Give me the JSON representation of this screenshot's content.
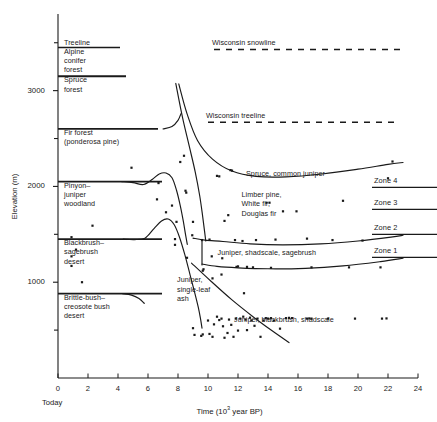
{
  "chart_data": {
    "type": "line",
    "title": "",
    "xlabel": "Time (10³ year BP)",
    "ylabel": "Elevation (m)",
    "xlim": [
      0,
      24
    ],
    "ylim": [
      0,
      3800
    ],
    "grid": false,
    "legend_position": "none",
    "x_ticks_major": [
      0,
      2,
      4,
      6,
      8,
      10,
      12,
      14,
      16,
      18,
      20,
      22,
      24
    ],
    "x_tick_labels": [
      "0",
      "2",
      "4",
      "6",
      "8",
      "10",
      "12",
      "14",
      "16",
      "18",
      "20",
      "22",
      "24"
    ],
    "x_origin_note": "Today",
    "y_ticks_major": [
      1000,
      2000,
      3000
    ],
    "y_tick_labels": [
      "1000",
      "2000",
      "3000"
    ],
    "y_ticks_minor": [
      500,
      1500,
      2500,
      3500
    ],
    "vegetation_bands": [
      {
        "label": "Treeline",
        "elevation": 3500,
        "type": "tick-label"
      },
      {
        "label": "Alpine\nconifer\nforest",
        "top": 3450,
        "bottom": 3150
      },
      {
        "label": "Spruce\nforest",
        "top": 3150,
        "bottom": 2600
      },
      {
        "label": "Fir forest\n(ponderosa pine)",
        "top": 2600,
        "bottom": 2050
      },
      {
        "label": "Pinyon–\njuniper\nwoodland",
        "top": 2050,
        "bottom": 1450
      },
      {
        "label": "Blackbrush–\nsagebrush\ndesert",
        "top": 1450,
        "bottom": 880
      },
      {
        "label": "Brittle-bush–\ncreosote bush\ndesert",
        "top": 880,
        "bottom": 300
      }
    ],
    "reference_lines": [
      {
        "name": "Wisconsin snowline",
        "style": "dashed",
        "elevation": 3430,
        "x_start": 10.4,
        "x_end": 22.8
      },
      {
        "name": "Wisconsin treeline",
        "style": "dashed",
        "elevation": 2670,
        "x_start": 10.0,
        "x_end": 22.8
      }
    ],
    "curve_labels": [
      {
        "text": "Spruce, common juniper",
        "x": 12.6,
        "y": 2130
      },
      {
        "text": "Limber pine,\nWhite fir,\nDouglas fir",
        "x": 12.3,
        "y": 1910
      },
      {
        "text": "Juniper, shadscale, sagebrush",
        "x": 10.7,
        "y": 1310
      },
      {
        "text": "Juniper,\nsingle-leaf\nash",
        "x": 8.0,
        "y": 1020
      },
      {
        "text": "Juniper, blackbrush, shadscale",
        "x": 11.8,
        "y": 610
      }
    ],
    "zones": [
      {
        "label": "Zone 4",
        "elevation": 1990
      },
      {
        "label": "Zone 3",
        "elevation": 1760
      },
      {
        "label": "Zone 2",
        "elevation": 1500
      },
      {
        "label": "Zone 1",
        "elevation": 1260
      }
    ],
    "series": [
      {
        "name": "spruce-common-juniper-boundary",
        "points": [
          [
            8.05,
            3070
          ],
          [
            8.6,
            2760
          ],
          [
            9.3,
            2480
          ],
          [
            10.3,
            2285
          ],
          [
            11.6,
            2160
          ],
          [
            13.2,
            2105
          ],
          [
            15.2,
            2100
          ],
          [
            17.6,
            2130
          ],
          [
            20.0,
            2180
          ],
          [
            22.0,
            2230
          ],
          [
            23.0,
            2250
          ]
        ]
      },
      {
        "name": "limber-pine-white-fir-boundary",
        "points": [
          [
            7.85,
            3075
          ],
          [
            8.3,
            2720
          ],
          [
            8.75,
            2420
          ],
          [
            9.15,
            2150
          ],
          [
            9.45,
            1900
          ],
          [
            9.65,
            1680
          ],
          [
            9.78,
            1520
          ],
          [
            9.85,
            1430
          ]
        ]
      },
      {
        "name": "zone2-upper-boundary",
        "points": [
          [
            9.0,
            1460
          ],
          [
            9.8,
            1440
          ],
          [
            11.0,
            1425
          ],
          [
            12.8,
            1400
          ],
          [
            15.0,
            1390
          ],
          [
            17.5,
            1400
          ],
          [
            20.0,
            1430
          ],
          [
            22.2,
            1470
          ],
          [
            23.0,
            1490
          ]
        ]
      },
      {
        "name": "pinyon-juniper-rise",
        "points": [
          [
            4.25,
            2050
          ],
          [
            5.0,
            2040
          ],
          [
            5.7,
            2020
          ],
          [
            6.3,
            2075
          ],
          [
            6.75,
            2130
          ],
          [
            7.2,
            2140
          ],
          [
            7.6,
            2090
          ],
          [
            7.9,
            1960
          ],
          [
            8.15,
            1800
          ],
          [
            8.35,
            1640
          ],
          [
            8.5,
            1500
          ],
          [
            8.62,
            1395
          ]
        ]
      },
      {
        "name": "blackbrush-sagebrush-rise",
        "points": [
          [
            4.35,
            1450
          ],
          [
            5.1,
            1445
          ],
          [
            5.8,
            1460
          ],
          [
            6.4,
            1560
          ],
          [
            6.9,
            1640
          ],
          [
            7.35,
            1660
          ],
          [
            7.75,
            1600
          ],
          [
            8.1,
            1470
          ],
          [
            8.45,
            1290
          ],
          [
            8.8,
            1080
          ],
          [
            9.1,
            900
          ],
          [
            9.35,
            740
          ],
          [
            9.5,
            620
          ],
          [
            9.6,
            520
          ]
        ]
      },
      {
        "name": "juniper-shadscale-boundary",
        "points": [
          [
            9.6,
            1190
          ],
          [
            10.6,
            1165
          ],
          [
            12.0,
            1150
          ],
          [
            14.0,
            1140
          ],
          [
            16.5,
            1145
          ],
          [
            19.0,
            1170
          ],
          [
            21.5,
            1215
          ],
          [
            23.0,
            1250
          ]
        ]
      },
      {
        "name": "juniper-blackbrush-diagonal",
        "points": [
          [
            8.9,
            1200
          ],
          [
            10.2,
            1010
          ],
          [
            11.6,
            815
          ],
          [
            13.0,
            640
          ],
          [
            14.3,
            490
          ],
          [
            15.4,
            370
          ]
        ]
      },
      {
        "name": "brittle-bush-boundary-short",
        "points": [
          [
            4.3,
            880
          ],
          [
            4.9,
            865
          ],
          [
            5.4,
            830
          ],
          [
            5.75,
            780
          ]
        ]
      },
      {
        "name": "spruce-forest-top-short",
        "points": [
          [
            7.0,
            2600
          ],
          [
            7.6,
            2625
          ],
          [
            8.0,
            2690
          ],
          [
            8.2,
            2760
          ]
        ]
      },
      {
        "name": "zone-separator-vertical",
        "points": [
          [
            9.6,
            1430
          ],
          [
            9.6,
            1180
          ]
        ]
      }
    ],
    "scatter_points": [
      [
        0.9,
        1470
      ],
      [
        0.9,
        1270
      ],
      [
        0.9,
        1170
      ],
      [
        1.2,
        1340
      ],
      [
        1.6,
        1000
      ],
      [
        2.3,
        1590
      ],
      [
        4.9,
        2195
      ],
      [
        6.6,
        1865
      ],
      [
        6.7,
        2035
      ],
      [
        7.2,
        1730
      ],
      [
        7.6,
        1800
      ],
      [
        7.8,
        1450
      ],
      [
        7.8,
        1390
      ],
      [
        7.9,
        1630
      ],
      [
        8.15,
        2255
      ],
      [
        8.4,
        2320
      ],
      [
        8.5,
        1955
      ],
      [
        8.55,
        1935
      ],
      [
        8.6,
        1255
      ],
      [
        8.95,
        1490
      ],
      [
        9.0,
        1630
      ],
      [
        9.6,
        1440
      ],
      [
        9.65,
        1120
      ],
      [
        9.7,
        1135
      ],
      [
        10.1,
        1445
      ],
      [
        10.25,
        1270
      ],
      [
        10.3,
        1040
      ],
      [
        10.6,
        2110
      ],
      [
        10.75,
        2105
      ],
      [
        10.9,
        1080
      ],
      [
        10.95,
        1250
      ],
      [
        11.1,
        1640
      ],
      [
        11.35,
        1700
      ],
      [
        11.5,
        2170
      ],
      [
        11.6,
        2165
      ],
      [
        11.8,
        1440
      ],
      [
        11.9,
        1160
      ],
      [
        12.0,
        1165
      ],
      [
        12.3,
        1430
      ],
      [
        12.4,
        885
      ],
      [
        12.6,
        1160
      ],
      [
        13.0,
        1155
      ],
      [
        13.2,
        1440
      ],
      [
        13.9,
        1830
      ],
      [
        14.1,
        1830
      ],
      [
        14.2,
        1150
      ],
      [
        14.5,
        1445
      ],
      [
        15.0,
        1740
      ],
      [
        15.9,
        1740
      ],
      [
        16.6,
        1455
      ],
      [
        16.9,
        1155
      ],
      [
        18.3,
        1440
      ],
      [
        19.0,
        1850
      ],
      [
        19.4,
        1155
      ],
      [
        20.3,
        1435
      ],
      [
        21.5,
        1155
      ],
      [
        22.0,
        2085
      ],
      [
        22.3,
        2260
      ],
      [
        9.0,
        520
      ],
      [
        9.1,
        450
      ],
      [
        9.55,
        440
      ],
      [
        9.65,
        455
      ],
      [
        10.0,
        600
      ],
      [
        10.1,
        460
      ],
      [
        10.3,
        430
      ],
      [
        10.4,
        560
      ],
      [
        10.6,
        640
      ],
      [
        10.75,
        605
      ],
      [
        10.9,
        620
      ],
      [
        11.0,
        540
      ],
      [
        11.1,
        420
      ],
      [
        11.3,
        470
      ],
      [
        11.4,
        610
      ],
      [
        11.55,
        555
      ],
      [
        11.7,
        430
      ],
      [
        11.85,
        620
      ],
      [
        12.0,
        495
      ],
      [
        12.15,
        620
      ],
      [
        12.35,
        640
      ],
      [
        12.5,
        610
      ],
      [
        12.6,
        500
      ],
      [
        12.8,
        630
      ],
      [
        12.9,
        600
      ],
      [
        13.1,
        545
      ],
      [
        13.3,
        620
      ],
      [
        13.5,
        430
      ],
      [
        13.7,
        600
      ],
      [
        13.85,
        625
      ],
      [
        14.0,
        620
      ],
      [
        14.2,
        625
      ],
      [
        14.4,
        600
      ],
      [
        14.8,
        515
      ],
      [
        15.2,
        625
      ],
      [
        15.4,
        628
      ],
      [
        15.6,
        625
      ],
      [
        16.6,
        620
      ],
      [
        16.75,
        622
      ],
      [
        16.9,
        620
      ],
      [
        18.0,
        620
      ],
      [
        19.8,
        620
      ],
      [
        21.6,
        620
      ],
      [
        21.9,
        622
      ]
    ]
  },
  "axes": {
    "x_title": "Time (10",
    "x_title_sup": "3",
    "x_title_tail": " year BP)",
    "y_title": "Elevation (m)",
    "today_label": "Today"
  }
}
